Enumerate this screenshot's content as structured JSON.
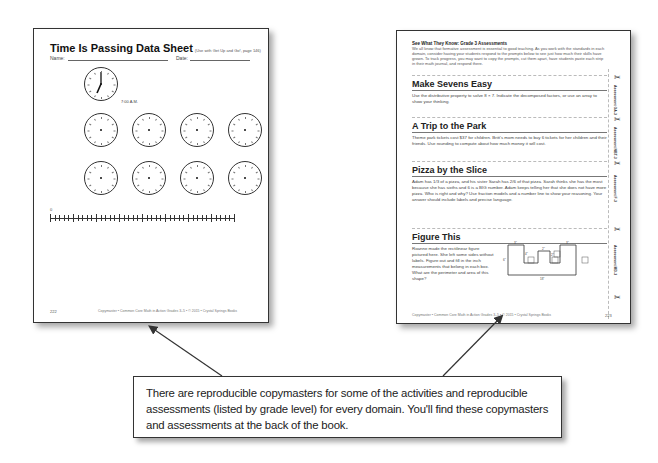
{
  "left_page": {
    "title": "Time Is Passing Data Sheet",
    "title_note": "(Use with Get Up and Go!, page 146)",
    "name_label": "Name:",
    "date_label": "Date:",
    "example_time": "7:00 A.M.",
    "numberline_start": "0",
    "page_number": "222",
    "footer": "Copymaster • Common Core Math in Action Grades 3–5 • © 2015 • Crystal Springs Books",
    "clock_count": 9
  },
  "right_page": {
    "intro_title": "See What They Know: Grade 3 Assessments",
    "intro_text": "We all know that formative assessment is essential to good teaching. As you work with the standards in each domain, consider having your students respond to the prompts below to see just how much their skills have grown. To track progress, you may want to copy the prompts, cut them apart, have students paste each strip in their math journal, and respond there.",
    "sections": [
      {
        "title": "Make Sevens Easy",
        "text": "Use the distributive property to solve 8 × 7. Indicate the decomposed factors, or use an array to show your thinking.",
        "side_label": "Assessment OA-3"
      },
      {
        "title": "A Trip to the Park",
        "text": "Theme park tickets cost $37 for children. Britt's mom needs to buy 6 tickets for her children and their friends. Use rounding to compute about how much money it will cost.",
        "side_label": "Assessment NBT-3"
      },
      {
        "title": "Pizza by the Slice",
        "text": "Adam has 1/3 of a pizza, and his sister Sarah has 2/6 of that pizza. Sarah thinks she has the most because she has sixths and 6 is a BIG number. Adam keeps telling her that she does not have more pizza. Who is right and why? Use fraction models and a number line to show your reasoning. Your answer should include labels and precise language.",
        "side_label": "Assessment F-3"
      },
      {
        "title": "Figure This",
        "text": "Roanne made the rectilinear figure pictured here. She left some sides without labels. Figure out and fill in the inch measurements that belong in each box. What are the perimeter and area of this shape?",
        "side_label": "Assessment MD-3"
      }
    ],
    "figure_labels": {
      "top_left": "3\"",
      "top_mid": "2\"",
      "top_right": "3\"",
      "left": "6\"",
      "inner_left": "4\"",
      "inner_right": "2\"",
      "bottom": "18\""
    },
    "page_number": "223",
    "footer": "Copymaster • Common Core Math in Action Grades 3–5 • © 2015 • Crystal Springs Books"
  },
  "callout": {
    "text": "There are reproducible copymasters for some of the activities and reproducible assessments (listed by grade level) for every domain. You'll find these copymasters and assessments at the back of the book."
  },
  "icons": {
    "scissor": "✂"
  }
}
